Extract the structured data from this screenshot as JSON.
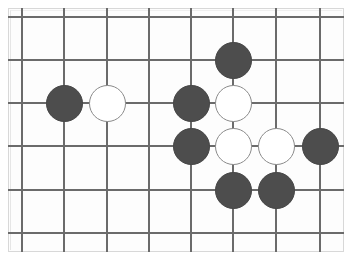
{
  "diagram": {
    "type": "go-board-diagram",
    "board": {
      "background_color": "#fdfdfd",
      "frame_color": "#d8d8d8",
      "line_color": "#6b6b6b",
      "line_width": 2,
      "origin_x": 22,
      "origin_y": 17,
      "cell_width": 43,
      "cell_height": 43,
      "columns": 8,
      "rows": 6,
      "vertical_line_x": [
        22,
        64,
        107,
        149,
        191,
        233,
        276,
        320
      ],
      "horizontal_line_y": [
        17,
        60,
        103,
        146,
        190,
        233
      ],
      "clip_left": 8,
      "clip_top": 8,
      "clip_width": 336,
      "clip_height": 244
    },
    "stone_style": {
      "diameter": 37,
      "black_fill": "#4d4d4d",
      "black_border": "#454545",
      "white_fill": "#ffffff",
      "white_border": "#8a8a8a"
    },
    "stones": [
      {
        "label": "black-stone-1",
        "color": "black",
        "cx": 64,
        "cy": 103
      },
      {
        "label": "white-stone-1",
        "color": "white",
        "cx": 107,
        "cy": 103
      },
      {
        "label": "black-stone-2",
        "color": "black",
        "cx": 233,
        "cy": 60
      },
      {
        "label": "black-stone-3",
        "color": "black",
        "cx": 191,
        "cy": 103
      },
      {
        "label": "white-stone-2",
        "color": "white",
        "cx": 233,
        "cy": 103
      },
      {
        "label": "black-stone-4",
        "color": "black",
        "cx": 191,
        "cy": 146
      },
      {
        "label": "white-stone-3",
        "color": "white",
        "cx": 233,
        "cy": 146
      },
      {
        "label": "white-stone-4",
        "color": "white",
        "cx": 276,
        "cy": 146
      },
      {
        "label": "black-stone-5",
        "color": "black",
        "cx": 320,
        "cy": 146
      },
      {
        "label": "black-stone-6",
        "color": "black",
        "cx": 233,
        "cy": 190
      },
      {
        "label": "black-stone-7",
        "color": "black",
        "cx": 276,
        "cy": 190
      }
    ]
  }
}
